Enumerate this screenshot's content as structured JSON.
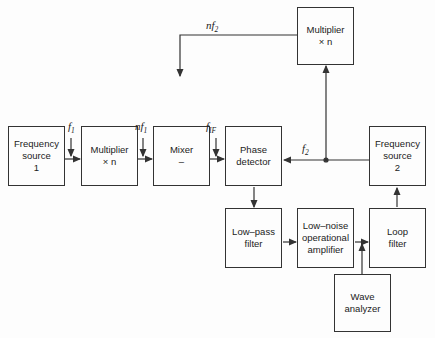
{
  "blocks": {
    "freq_source_1": {
      "line1": "Frequency",
      "line2": "source",
      "line3": "1"
    },
    "multiplier_1": {
      "line1": "Multiplier",
      "line2": "× n"
    },
    "mixer": {
      "line1": "Mixer",
      "line2": "–"
    },
    "phase_detector": {
      "line1": "Phase",
      "line2": "detector"
    },
    "multiplier_2": {
      "line1": "Multiplier",
      "line2": "× n"
    },
    "freq_source_2": {
      "line1": "Frequency",
      "line2": "source",
      "line3": "2"
    },
    "low_pass_filter": {
      "line1": "Low–pass",
      "line2": "filter"
    },
    "low_noise_amp": {
      "line1": "Low–noise",
      "line2": "operational",
      "line3": "amplifier"
    },
    "loop_filter": {
      "line1": "Loop",
      "line2": "filter"
    },
    "wave_analyzer": {
      "line1": "Wave",
      "line2": "analyzer"
    }
  },
  "signals": {
    "f1": {
      "base": "f",
      "sub": "1"
    },
    "nf1": {
      "base": "nf",
      "sub": "1"
    },
    "nf2": {
      "base": "nf",
      "sub": "2"
    },
    "fIF": {
      "base": "f",
      "sub": "IF"
    },
    "f2": {
      "base": "f",
      "sub": "2"
    }
  }
}
